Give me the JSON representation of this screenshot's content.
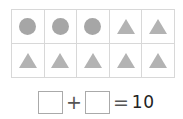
{
  "grid": {
    "rows": 2,
    "cols": 5,
    "cells": [
      "circle",
      "circle",
      "circle",
      "triangle",
      "triangle",
      "triangle",
      "triangle",
      "triangle",
      "triangle",
      "triangle"
    ]
  },
  "equation": {
    "box1_value": "",
    "plus": "+",
    "box2_value": "",
    "equals": "=",
    "result": "10"
  },
  "colors": {
    "circle": "#a6a6a6",
    "triangle": "#b3b3b3",
    "grid_line": "#d8d8d8"
  }
}
